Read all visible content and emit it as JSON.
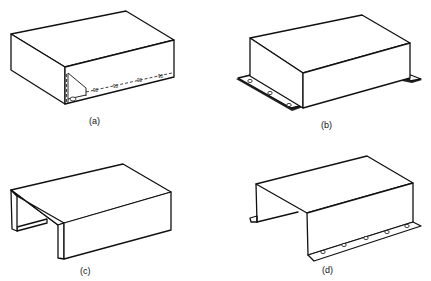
{
  "figure": {
    "panels": [
      {
        "id": "a",
        "label": "(a)",
        "description": "Closed rectangular box cover with cutaway corner showing internal seam and bend annotations",
        "annotations": [
          "90",
          "90",
          "90",
          "90"
        ]
      },
      {
        "id": "b",
        "label": "(b)",
        "description": "Rectangular box with flat mounting flanges at base, three holes on front-left flange"
      },
      {
        "id": "c",
        "label": "(c)",
        "description": "U-shaped open-ended channel cover, three-sided"
      },
      {
        "id": "d",
        "label": "(d)",
        "description": "U-shaped cover with outward mounting flanges, five holes along front flange"
      }
    ],
    "colors": {
      "line": "#111111",
      "background": "#ffffff"
    }
  }
}
